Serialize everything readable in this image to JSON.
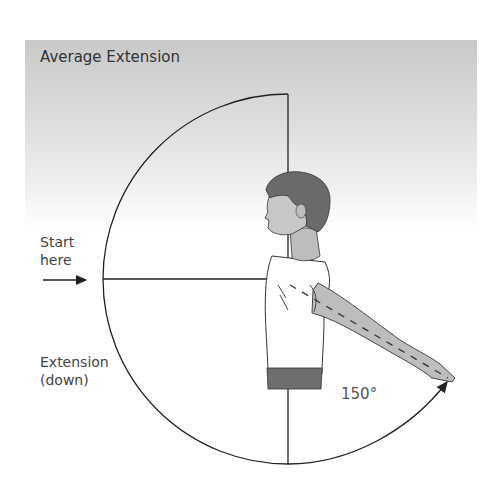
{
  "title": "Average Extension",
  "labels": {
    "start_line1": "Start",
    "start_line2": "here",
    "extension_line1": "Extension",
    "extension_line2": "(down)",
    "angle": "150°"
  },
  "colors": {
    "line": "#222222",
    "hair": "#6a6a6a",
    "skin": "#bdbdbd",
    "sleeve": "#bdbdbd",
    "belt": "#6e6e6e",
    "shirt": "#ffffff"
  },
  "geometry": {
    "center": [
      288,
      279
    ],
    "radius": 185,
    "angle_degrees": 150
  }
}
